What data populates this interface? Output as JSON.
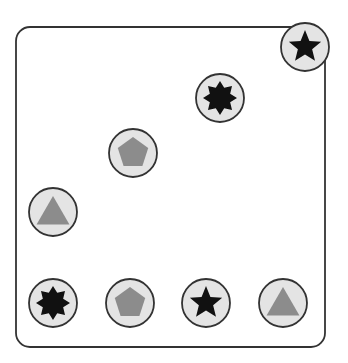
{
  "board": {
    "frame": {
      "x": 16,
      "y": 27,
      "width": 309,
      "height": 320,
      "radius": 14,
      "stroke": "#333333"
    },
    "colors": {
      "circle_fill": "#e4e4e4",
      "circle_stroke": "#333333",
      "dark_shape": "#111111",
      "gray_shape": "#8c8c8c"
    },
    "tokens": [
      {
        "id": "star-top-right",
        "shape": "star",
        "tone": "dark",
        "cx": 305,
        "cy": 47
      },
      {
        "id": "octagram-top",
        "shape": "octagram",
        "tone": "dark",
        "cx": 220,
        "cy": 98
      },
      {
        "id": "pentagon-middle",
        "shape": "pentagon",
        "tone": "gray",
        "cx": 133,
        "cy": 153
      },
      {
        "id": "triangle-left",
        "shape": "triangle",
        "tone": "gray",
        "cx": 53,
        "cy": 212
      },
      {
        "id": "octagram-bottom-1",
        "shape": "octagram",
        "tone": "dark",
        "cx": 53,
        "cy": 303
      },
      {
        "id": "pentagon-bottom-2",
        "shape": "pentagon",
        "tone": "gray",
        "cx": 130,
        "cy": 303
      },
      {
        "id": "star-bottom-3",
        "shape": "star",
        "tone": "dark",
        "cx": 206,
        "cy": 303
      },
      {
        "id": "triangle-bottom-4",
        "shape": "triangle",
        "tone": "gray",
        "cx": 283,
        "cy": 303
      }
    ],
    "token_radius": 24
  }
}
